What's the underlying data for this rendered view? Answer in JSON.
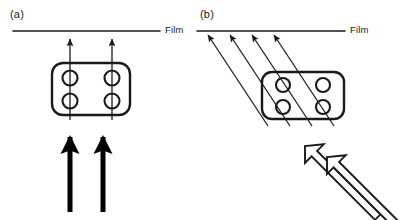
{
  "figure": {
    "width": 404,
    "height": 220,
    "background": "#ffffff",
    "stroke_color": "#1a1a1a",
    "type": "scientific-schematic"
  },
  "panels": [
    {
      "id": "a",
      "label": "(a)",
      "film_label": "Film",
      "film_line": {
        "x1": 13,
        "y1": 31,
        "x2": 160,
        "y2": 31,
        "width": 1.6
      },
      "sample_box": {
        "x": 52,
        "y": 63,
        "width": 78,
        "height": 52,
        "radius": 11,
        "stroke_width": 2.4
      },
      "pores": [
        {
          "cx": 70,
          "cy": 78,
          "r": 7.5
        },
        {
          "cx": 112,
          "cy": 78,
          "r": 7.5
        },
        {
          "cx": 70,
          "cy": 101,
          "r": 7.5
        },
        {
          "cx": 112,
          "cy": 101,
          "r": 7.5
        }
      ],
      "thin_arrows": [
        {
          "x1": 70,
          "y1": 120,
          "x2": 70,
          "y2": 38
        },
        {
          "x1": 112,
          "y1": 120,
          "x2": 112,
          "y2": 38
        }
      ],
      "thick_arrows": [
        {
          "x1": 70,
          "y1": 212,
          "x2": 70,
          "y2": 133
        },
        {
          "x1": 103,
          "y1": 212,
          "x2": 103,
          "y2": 133
        }
      ],
      "beam_direction": "vertical-normal-incidence"
    },
    {
      "id": "b",
      "label": "(b)",
      "film_label": "Film",
      "film_line": {
        "x1": 197,
        "y1": 31,
        "x2": 345,
        "y2": 31,
        "width": 1.6
      },
      "sample_box": {
        "x": 262,
        "y": 72,
        "width": 82,
        "height": 47,
        "radius": 10,
        "stroke_width": 2.4
      },
      "pores": [
        {
          "cx": 283,
          "cy": 85,
          "r": 7.0
        },
        {
          "cx": 323,
          "cy": 85,
          "r": 7.0
        },
        {
          "cx": 283,
          "cy": 107,
          "r": 7.0
        },
        {
          "cx": 323,
          "cy": 107,
          "r": 7.0
        }
      ],
      "thin_arrows": [
        {
          "x1": 268,
          "y1": 126,
          "x2": 207,
          "y2": 34
        },
        {
          "x1": 290,
          "y1": 126,
          "x2": 229,
          "y2": 34
        },
        {
          "x1": 312,
          "y1": 126,
          "x2": 251,
          "y2": 34
        },
        {
          "x1": 334,
          "y1": 126,
          "x2": 273,
          "y2": 34
        }
      ],
      "hollow_arrows": [
        {
          "tip_x": 305,
          "tip_y": 146,
          "tail_x": 372,
          "tail_y": 212,
          "shaft_width": 7
        },
        {
          "tip_x": 327,
          "tip_y": 157,
          "tail_x": 394,
          "tail_y": 222,
          "shaft_width": 7
        }
      ],
      "beam_direction": "oblique-incidence"
    }
  ]
}
